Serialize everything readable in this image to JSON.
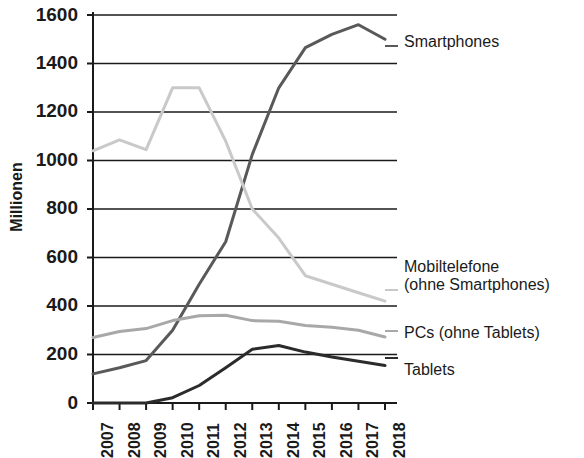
{
  "chart_data": {
    "type": "line",
    "title": "",
    "xlabel": "",
    "ylabel": "Millionen",
    "categories": [
      "2007",
      "2008",
      "2009",
      "2010",
      "2011",
      "2012",
      "2013",
      "2014",
      "2015",
      "2016",
      "2017",
      "2018"
    ],
    "ylim": [
      0,
      1600
    ],
    "yticks": [
      0,
      200,
      400,
      600,
      800,
      1000,
      1200,
      1400,
      1600
    ],
    "ytick_labels": [
      "0",
      "200",
      "400",
      "600",
      "800",
      "1000",
      "1200",
      "1400",
      "1600"
    ],
    "grid": true,
    "legend_position": "right-inline",
    "series": [
      {
        "name": "Smartphones",
        "color": "#595959",
        "values": [
          120,
          145,
          175,
          300,
          490,
          665,
          1025,
          1300,
          1465,
          1520,
          1560,
          1500
        ]
      },
      {
        "name": "Mobiltelefone (ohne Smartphones)",
        "color": "#c9c9c9",
        "values": [
          1040,
          1085,
          1045,
          1300,
          1300,
          1080,
          800,
          680,
          525,
          490,
          455,
          420
        ]
      },
      {
        "name": "PCs (ohne Tablets)",
        "color": "#a8a8a8",
        "values": [
          270,
          295,
          307,
          340,
          360,
          362,
          340,
          337,
          320,
          312,
          300,
          272
        ]
      },
      {
        "name": "Tablets",
        "color": "#2b2b2b",
        "values": [
          0,
          0,
          0,
          22,
          72,
          145,
          222,
          237,
          210,
          190,
          172,
          155
        ]
      }
    ]
  },
  "legend": {
    "entries": [
      {
        "label": "Smartphones",
        "line2": ""
      },
      {
        "label": "Mobiltelefone",
        "line2": "(ohne Smartphones)"
      },
      {
        "label": "PCs (ohne Tablets)",
        "line2": ""
      },
      {
        "label": "Tablets",
        "line2": ""
      }
    ]
  }
}
